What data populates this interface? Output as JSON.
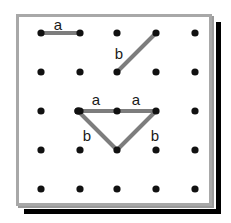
{
  "figure": {
    "board": {
      "left": 16,
      "top": 14,
      "width": 196,
      "height": 192,
      "background": "#ffffff",
      "border_color": "#a8a8a8",
      "bevel_color": "#9a9a9a",
      "shadow_color": "#000000"
    },
    "grid": {
      "rows": 5,
      "cols": 5,
      "x_positions": [
        41,
        80,
        117,
        156,
        195
      ],
      "y_positions": [
        33,
        72,
        111,
        150,
        189
      ],
      "peg_radius": 3.6,
      "peg_color": "#111111"
    },
    "segment_style": {
      "color": "#7d7d7d",
      "width": 4
    },
    "segments": [
      {
        "name": "top-horizontal-segment-a",
        "x1": 41,
        "y1": 33,
        "x2": 80,
        "y2": 33,
        "label": "a"
      },
      {
        "name": "diagonal-segment-b",
        "x1": 117,
        "y1": 72,
        "x2": 156,
        "y2": 33,
        "label": "b"
      },
      {
        "name": "triangle-top-left-a",
        "x1": 78,
        "y1": 111,
        "x2": 117,
        "y2": 111,
        "label": "a"
      },
      {
        "name": "triangle-top-right-a",
        "x1": 117,
        "y1": 111,
        "x2": 156,
        "y2": 111,
        "label": "a"
      },
      {
        "name": "triangle-left-b",
        "x1": 78,
        "y1": 111,
        "x2": 117,
        "y2": 150,
        "label": "b"
      },
      {
        "name": "triangle-right-b",
        "x1": 156,
        "y1": 111,
        "x2": 117,
        "y2": 150,
        "label": "b"
      }
    ],
    "labels": [
      {
        "name": "label-top-a",
        "text": "a",
        "x": 58,
        "y": 24
      },
      {
        "name": "label-diagonal-b",
        "text": "b",
        "x": 119,
        "y": 53
      },
      {
        "name": "label-triangle-left-a",
        "text": "a",
        "x": 96,
        "y": 99
      },
      {
        "name": "label-triangle-right-a",
        "text": "a",
        "x": 136,
        "y": 99
      },
      {
        "name": "label-triangle-left-b",
        "text": "b",
        "x": 87,
        "y": 135
      },
      {
        "name": "label-triangle-right-b",
        "text": "b",
        "x": 155,
        "y": 135
      }
    ]
  }
}
